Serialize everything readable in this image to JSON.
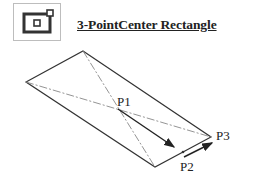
{
  "header": {
    "icon": "three-point-center-rectangle-icon",
    "title": "3-PointCenter Rectangle"
  },
  "diagram": {
    "labels": {
      "p1": "P1",
      "p2": "P2",
      "p3": "P3"
    },
    "colors": {
      "line": "#333333",
      "centerline": "#888888"
    }
  }
}
